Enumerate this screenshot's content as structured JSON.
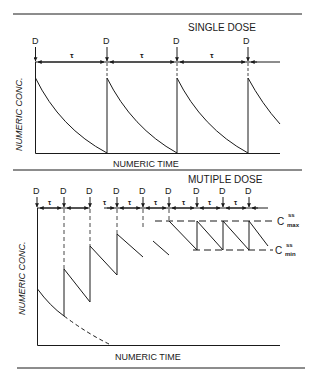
{
  "top_panel": {
    "title": "SINGLE DOSE",
    "dose_label": "D",
    "interval_label": "τ",
    "y_axis_label": "NUMERIC CONC.",
    "x_axis_label": "NUMERIC TIME",
    "dose_count": 4
  },
  "bottom_panel": {
    "title": "MUTIPLE DOSE",
    "dose_label": "D",
    "interval_label": "τ",
    "y_axis_label": "NUMERIC CONC.",
    "x_axis_label": "NUMERIC TIME",
    "dose_count": 9,
    "cmax_label": "C",
    "cmax_super": "ss",
    "cmax_sub": "max",
    "cmin_label": "C",
    "cmin_super": "ss",
    "cmin_sub": "min"
  },
  "colors": {
    "ink": "#1a1a1a",
    "background": "#ffffff"
  }
}
